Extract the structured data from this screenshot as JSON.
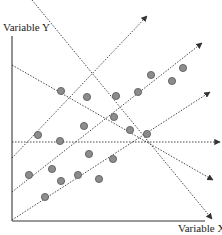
{
  "chart_data": {
    "type": "scatter",
    "title": "",
    "xlabel": "Variable X",
    "ylabel": "Variable Y",
    "grid": false,
    "colors": {
      "axis": "#777777",
      "lines": "#333333",
      "point_fill": "#8c8c8c",
      "point_stroke": "#555555"
    },
    "points_px": [
      [
        61,
        91
      ],
      [
        87,
        97
      ],
      [
        116,
        96
      ],
      [
        138,
        92
      ],
      [
        151,
        75
      ],
      [
        183,
        68
      ],
      [
        172,
        81
      ],
      [
        114,
        117
      ],
      [
        84,
        126
      ],
      [
        130,
        130
      ],
      [
        147,
        134
      ],
      [
        38,
        135
      ],
      [
        60,
        141
      ],
      [
        89,
        154
      ],
      [
        113,
        159
      ],
      [
        29,
        175
      ],
      [
        52,
        169
      ],
      [
        61,
        181
      ],
      [
        78,
        175
      ],
      [
        99,
        179
      ],
      [
        45,
        197
      ]
    ],
    "lines_px": [
      {
        "name": "steep-decreasing",
        "from": [
          32,
          0
        ],
        "to": [
          212,
          219
        ],
        "arrow": true
      },
      {
        "name": "decreasing",
        "from": [
          12,
          65
        ],
        "to": [
          213,
          180
        ],
        "arrow": true
      },
      {
        "name": "horizontal",
        "from": [
          12,
          142
        ],
        "to": [
          220,
          142
        ],
        "arrow": true
      },
      {
        "name": "increasing-upper",
        "from": [
          12,
          158
        ],
        "to": [
          147,
          16
        ],
        "arrow": true
      },
      {
        "name": "increasing-middle",
        "from": [
          12,
          192
        ],
        "to": [
          202,
          43
        ],
        "arrow": true
      },
      {
        "name": "increasing-lower",
        "from": [
          12,
          220
        ],
        "to": [
          210,
          92
        ],
        "arrow": true
      }
    ],
    "axes_px": {
      "origin": [
        12,
        221
      ],
      "y_top": 36,
      "x_right": 205
    }
  },
  "labels": {
    "x_axis": "Variable X",
    "y_axis": "Variable Y"
  }
}
